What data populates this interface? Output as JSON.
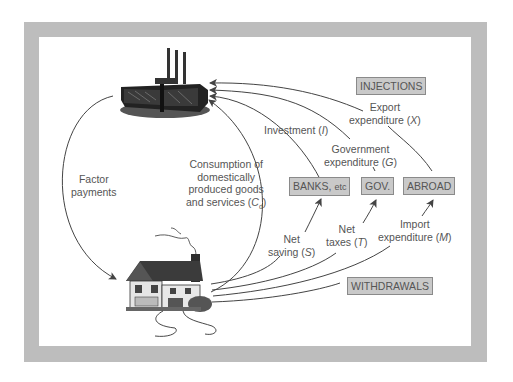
{
  "diagram": {
    "nodes": {
      "firms": {
        "label": "Firms",
        "icon": "factory-icon"
      },
      "households": {
        "label": "Households",
        "icon": "house-icon"
      }
    },
    "boxes": {
      "injections": "INJECTIONS",
      "withdrawals": "WITHDRAWALS",
      "banks": "BANKS,",
      "banks_suffix": "etc",
      "gov": "GOV.",
      "abroad": "ABROAD"
    },
    "labels": {
      "factor_payments": [
        "Factor",
        "payments"
      ],
      "consumption": [
        "Consumption of",
        "domestically",
        "produced goods",
        "and services ("
      ],
      "consumption_symbol": "C",
      "consumption_sub": "d",
      "investment": "Investment (",
      "investment_symbol": "I",
      "government": [
        "Government",
        "expenditure ("
      ],
      "government_symbol": "G",
      "export": [
        "Export",
        "expenditure ("
      ],
      "export_symbol": "X",
      "net_saving": [
        "Net",
        "saving ("
      ],
      "net_saving_symbol": "S",
      "net_taxes": [
        "Net",
        "taxes ("
      ],
      "net_taxes_symbol": "T",
      "import": [
        "Import",
        "expenditure ("
      ],
      "import_symbol": "M",
      "close_paren": ")"
    },
    "colors": {
      "frame": "#bdbdbd",
      "box_fill": "#c9c9c9",
      "line": "#444444",
      "text": "#555555"
    }
  }
}
